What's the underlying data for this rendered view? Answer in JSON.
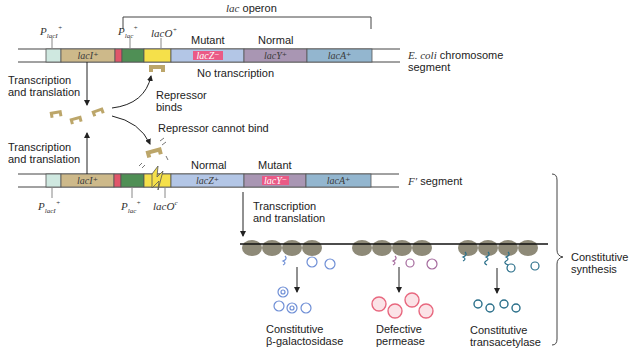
{
  "title_bracket": {
    "label": "lac operon"
  },
  "chromosome": {
    "label_italic": "E. coli",
    "label_rest": "chromosome",
    "label_line2": "segment",
    "promoter_laci": "P",
    "promoter_laci_sub": "lacI",
    "promoter_laci_sup": "+",
    "promoter_lac": "P",
    "promoter_lac_sub": "lac",
    "promoter_lac_sup": "+",
    "operator": "lacO",
    "operator_sup": "+",
    "genes": [
      {
        "id": "lacI",
        "label": "lacI⁺",
        "color": "#cdb98a"
      },
      {
        "id": "lacZ",
        "label": "lacZ⁻",
        "color": "#b3c6e6",
        "mutant": true
      },
      {
        "id": "lacY",
        "label": "lacY⁺",
        "color": "#a996b3"
      },
      {
        "id": "lacA",
        "label": "lacA⁺",
        "color": "#93b6cf"
      }
    ],
    "status_lacZ": "Mutant",
    "status_lacY": "Normal",
    "no_transcription": "No transcription"
  },
  "fprime": {
    "label_italic": "F′",
    "label_rest": "segment",
    "promoter_laci": "P",
    "promoter_laci_sub": "lacI",
    "promoter_laci_sup": "+",
    "promoter_lac": "P",
    "promoter_lac_sub": "lac",
    "promoter_lac_sup": "+",
    "operator": "lacO",
    "operator_sup": "c",
    "genes": [
      {
        "id": "lacI",
        "label": "lacI⁺"
      },
      {
        "id": "lacZ",
        "label": "lacZ⁺"
      },
      {
        "id": "lacY",
        "label": "lacY⁻",
        "mutant": true
      },
      {
        "id": "lacA",
        "label": "lacA⁺"
      }
    ],
    "status_lacZ": "Normal",
    "status_lacY": "Mutant"
  },
  "annotations": {
    "tt_top_1": "Transcription",
    "tt_top_2": "and translation",
    "tt_bottom_1": "Transcription",
    "tt_bottom_2": "and translation",
    "repressor_binds_1": "Repressor",
    "repressor_binds_2": "binds",
    "repressor_cannot": "Repressor cannot bind",
    "tt_right_1": "Transcription",
    "tt_right_2": "and translation",
    "constitutive_synthesis_1": "Constitutive",
    "constitutive_synthesis_2": "synthesis"
  },
  "products": [
    {
      "line1": "Constitutive",
      "line2": "β-galactosidase",
      "color": "#6f8fd6"
    },
    {
      "line1": "Defective",
      "line2": "permease",
      "color": "#e8687f"
    },
    {
      "line1": "Constitutive",
      "line2": "transacetylase",
      "color": "#2a6f8a"
    }
  ],
  "colors": {
    "promoter_laci": "#cfe8e0",
    "laci": "#cdb98a",
    "promoter_lac_red": "#e0566a",
    "promoter_lac_green": "#4f8f55",
    "operator": "#f5e04a",
    "lacZ": "#b3c6e6",
    "lacY": "#a996b3",
    "lacA": "#93b6cf",
    "mutant_box": "#ea5a86",
    "repressor": "#bca66a",
    "ribosome": "#8e8a78"
  }
}
